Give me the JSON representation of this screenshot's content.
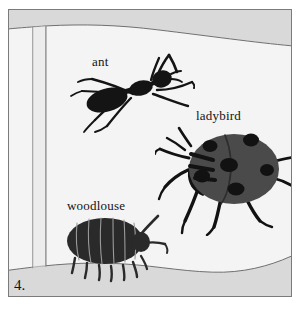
{
  "figure": {
    "number_label": "4.",
    "frame_border_color": "#7b7b7b",
    "page_color": "#f4f4f4",
    "band_color": "#d8d8d8",
    "ink_color": "#131313"
  },
  "labels": {
    "ant": "ant",
    "ladybird": "ladybird",
    "woodlouse": "woodlouse"
  },
  "specimens": [
    {
      "name": "ant",
      "label": "ant",
      "body_color": "#141414",
      "legs": 6,
      "antennae": 2,
      "orientation": "facing-right"
    },
    {
      "name": "ladybird",
      "label": "ladybird",
      "body_color": "#4a4a4a",
      "spot_color": "#121212",
      "spots": 6,
      "legs": 6,
      "antennae": 2,
      "orientation": "facing-left"
    },
    {
      "name": "woodlouse",
      "label": "woodlouse",
      "body_color": "#2a2a2a",
      "segments": 7,
      "legs": 7,
      "antennae": 2,
      "orientation": "facing-right"
    }
  ],
  "icons": {
    "ant": "ant-icon",
    "ladybird": "ladybird-icon",
    "woodlouse": "woodlouse-icon"
  }
}
